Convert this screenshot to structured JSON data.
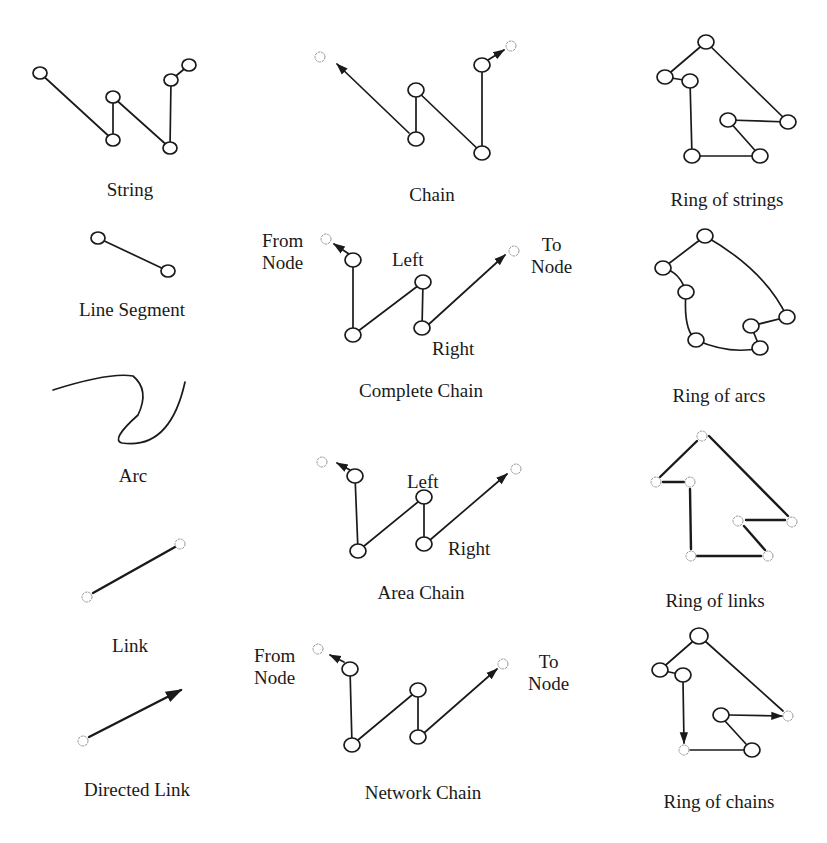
{
  "figure": {
    "colors": {
      "ink": "#1a1a1a",
      "link_node": "#9a9a9a",
      "background": "#ffffff"
    },
    "node_symbols": {
      "node": "open-circle",
      "link_end": "dashed-star"
    }
  },
  "captions": {
    "string": "String",
    "chain": "Chain",
    "ring_of_strings": "Ring of strings",
    "line_segment": "Line Segment",
    "complete_chain": "Complete Chain",
    "ring_of_arcs": "Ring of arcs",
    "arc": "Arc",
    "area_chain": "Area Chain",
    "ring_of_links": "Ring of links",
    "link": "Link",
    "network_chain": "Network Chain",
    "directed_link": "Directed Link",
    "ring_of_chains": "Ring of chains"
  },
  "annotations": {
    "complete_chain": {
      "from_node": "From\nNode",
      "to_node": "To\nNode",
      "left": "Left",
      "right": "Right"
    },
    "area_chain": {
      "left": "Left",
      "right": "Right"
    },
    "network_chain": {
      "from_node": "From\nNode",
      "to_node": "To\nNode"
    }
  },
  "shapes": {
    "string": {
      "nodes": [
        [
          40,
          73
        ],
        [
          113,
          140
        ],
        [
          113,
          97
        ],
        [
          170,
          148
        ],
        [
          171,
          80
        ],
        [
          189,
          65
        ]
      ],
      "edges": [
        [
          0,
          1
        ],
        [
          1,
          2
        ],
        [
          2,
          3
        ],
        [
          3,
          4
        ],
        [
          4,
          5
        ]
      ]
    },
    "chain": {
      "nodes": [
        [
          416,
          139
        ],
        [
          416,
          90
        ],
        [
          482,
          153
        ],
        [
          482,
          65
        ]
      ],
      "edges": [
        [
          0,
          1
        ],
        [
          1,
          2
        ],
        [
          2,
          3
        ]
      ],
      "start_star": [
        320,
        57
      ],
      "arrow_from": [
        409,
        133
      ],
      "arrow_to": [
        337,
        63
      ],
      "end_star": [
        511,
        46
      ],
      "end_arrow_from": [
        486,
        60
      ],
      "end_arrow_to": [
        506,
        49
      ]
    },
    "ring_of_strings": {
      "nodes": [
        [
          706,
          42
        ],
        [
          665,
          77
        ],
        [
          690,
          81
        ],
        [
          788,
          122
        ],
        [
          728,
          120
        ],
        [
          760,
          156
        ],
        [
          692,
          156
        ]
      ],
      "edges": [
        [
          0,
          1
        ],
        [
          1,
          2
        ],
        [
          2,
          6
        ],
        [
          6,
          5
        ],
        [
          5,
          4
        ],
        [
          4,
          3
        ],
        [
          3,
          0
        ]
      ]
    },
    "line_segment": {
      "nodes": [
        [
          98,
          238
        ],
        [
          168,
          271
        ]
      ],
      "edges": [
        [
          0,
          1
        ]
      ]
    },
    "complete_chain": {
      "nodes": [
        [
          353,
          260
        ],
        [
          353,
          335
        ],
        [
          423,
          282
        ],
        [
          422,
          328
        ]
      ],
      "edges": [
        [
          0,
          1
        ],
        [
          1,
          2
        ],
        [
          2,
          3
        ]
      ],
      "start_star": [
        326,
        239
      ],
      "start_arrow_to": [
        333,
        245
      ],
      "end_star": [
        514,
        251
      ],
      "end_arrow_from": [
        428,
        325
      ],
      "end_arrow_to": [
        506,
        255
      ]
    },
    "ring_of_arcs": {
      "nodes": [
        [
          705,
          236
        ],
        [
          663,
          268
        ],
        [
          686,
          292
        ],
        [
          696,
          340
        ],
        [
          760,
          348
        ],
        [
          751,
          326
        ],
        [
          787,
          317
        ]
      ]
    },
    "area_chain": {
      "nodes": [
        [
          355,
          476
        ],
        [
          358,
          551
        ],
        [
          424,
          497
        ],
        [
          424,
          544
        ]
      ],
      "start_star": [
        322,
        462
      ],
      "start_arrow_to": [
        336,
        463
      ],
      "end_star": [
        516,
        469
      ],
      "end_arrow_from": [
        430,
        540
      ],
      "end_arrow_to": [
        508,
        473
      ]
    },
    "ring_of_links": {
      "nodes": [
        [
          702,
          436
        ],
        [
          656,
          482
        ],
        [
          690,
          482
        ],
        [
          792,
          522
        ],
        [
          738,
          521
        ],
        [
          768,
          556
        ],
        [
          691,
          556
        ]
      ],
      "edges": [
        [
          0,
          1
        ],
        [
          1,
          2
        ],
        [
          2,
          6
        ],
        [
          6,
          5
        ],
        [
          5,
          4
        ],
        [
          4,
          3
        ],
        [
          3,
          0
        ]
      ]
    },
    "link": {
      "start": [
        87,
        597
      ],
      "end": [
        180,
        544
      ]
    },
    "directed_link": {
      "start": [
        83,
        741
      ],
      "end": [
        183,
        689
      ]
    },
    "network_chain": {
      "nodes": [
        [
          350,
          669
        ],
        [
          352,
          745
        ],
        [
          418,
          690
        ],
        [
          418,
          737
        ]
      ],
      "start_star": [
        318,
        649
      ],
      "start_arrow_to": [
        329,
        655
      ],
      "end_star": [
        503,
        664
      ],
      "end_arrow_from": [
        424,
        733
      ],
      "end_arrow_to": [
        498,
        668
      ]
    },
    "ring_of_chains": {
      "nodes": [
        [
          699,
          636
        ],
        [
          660,
          670
        ],
        [
          683,
          675
        ],
        [
          721,
          715
        ],
        [
          752,
          750
        ]
      ],
      "stars": [
        [
          788,
          716
        ],
        [
          684,
          750
        ]
      ]
    }
  }
}
